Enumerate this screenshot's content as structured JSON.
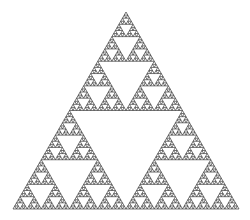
{
  "figure": {
    "title": "Sierpinski triangle",
    "background": "#ffffff",
    "stroke_color": "#3a3a3a",
    "fill_color": "#ffffff",
    "stroke_width": 0.7,
    "depth": 6,
    "vertices": {
      "apex": [
        126,
        12
      ],
      "bottom_left": [
        13,
        209
      ],
      "bottom_right": [
        239,
        209
      ]
    }
  }
}
